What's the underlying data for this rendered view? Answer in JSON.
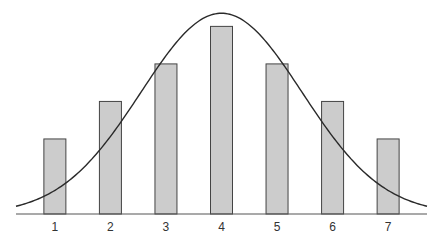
{
  "chart_data": {
    "type": "bar",
    "title": "",
    "xlabel": "",
    "ylabel": "",
    "categories": [
      "1",
      "2",
      "3",
      "4",
      "5",
      "6",
      "7"
    ],
    "values": [
      2,
      3,
      4,
      5,
      4,
      3,
      2
    ],
    "ylim": [
      0,
      5.65
    ],
    "xlim": [
      0.3,
      7.7
    ],
    "grid": false,
    "legend": "none",
    "overlay_curve": {
      "type": "normal-distribution",
      "mean": 4,
      "peak": 5.35,
      "std": 1.45,
      "range": [
        0.3,
        7.7
      ]
    },
    "colors": {
      "bar_fill": "#cccccc",
      "bar_stroke": "#444444",
      "curve": "#2a2a2a",
      "axis": "#555555"
    }
  }
}
